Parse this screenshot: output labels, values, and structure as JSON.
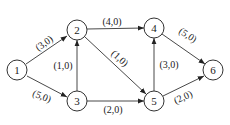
{
  "graph": {
    "type": "directed network (flow)",
    "nodes": [
      {
        "id": "1",
        "label": "1",
        "x": 17,
        "y": 70
      },
      {
        "id": "2",
        "label": "2",
        "x": 77,
        "y": 30
      },
      {
        "id": "3",
        "label": "3",
        "x": 77,
        "y": 101
      },
      {
        "id": "4",
        "label": "4",
        "x": 154,
        "y": 28
      },
      {
        "id": "5",
        "label": "5",
        "x": 154,
        "y": 101
      },
      {
        "id": "6",
        "label": "6",
        "x": 213,
        "y": 70
      }
    ],
    "edges": [
      {
        "from": "1",
        "to": "2",
        "label": "(3,0)",
        "lx": 43,
        "ly": 43,
        "rot": -35
      },
      {
        "from": "1",
        "to": "3",
        "label": "(5,0)",
        "lx": 42,
        "ly": 96,
        "rot": 22
      },
      {
        "from": "3",
        "to": "2",
        "label": "(1,0)",
        "lx": 63,
        "ly": 65,
        "rot": 0
      },
      {
        "from": "2",
        "to": "4",
        "label": "(4,0)",
        "lx": 112,
        "ly": 20,
        "rot": 0
      },
      {
        "from": "2",
        "to": "5",
        "label": "(1,0)",
        "lx": 118,
        "ly": 60,
        "rot": 40
      },
      {
        "from": "3",
        "to": "5",
        "label": "(2,0)",
        "lx": 114,
        "ly": 110,
        "rot": 0
      },
      {
        "from": "5",
        "to": "4",
        "label": "(3,0)",
        "lx": 170,
        "ly": 65,
        "rot": 0
      },
      {
        "from": "4",
        "to": "6",
        "label": "(5,0)",
        "lx": 187,
        "ly": 36,
        "rot": 33
      },
      {
        "from": "5",
        "to": "6",
        "label": "(2,0)",
        "lx": 183,
        "ly": 96,
        "rot": -25
      }
    ]
  },
  "labels": {
    "n1": "1",
    "n2": "2",
    "n3": "3",
    "n4": "4",
    "n5": "5",
    "n6": "6",
    "e12": "(3,0)",
    "e13": "(5,0)",
    "e32": "(1,0)",
    "e24": "(4,0)",
    "e25": "(1,0)",
    "e35": "(2,0)",
    "e54": "(3,0)",
    "e46": "(5,0)",
    "e56": "(2,0)"
  }
}
